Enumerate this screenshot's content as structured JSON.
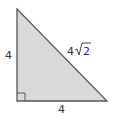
{
  "diagram": {
    "type": "right-triangle",
    "fill_color": "#d9d9d9",
    "stroke_color": "#555555",
    "vertices": {
      "top": [
        17,
        9
      ],
      "bottom_left": [
        17,
        101
      ],
      "bottom_right": [
        107,
        101
      ]
    },
    "labels": {
      "left_leg": "4",
      "bottom_leg": "4",
      "hypotenuse_coef": "4",
      "hypotenuse_radical": "2"
    },
    "right_angle_marker": true
  }
}
